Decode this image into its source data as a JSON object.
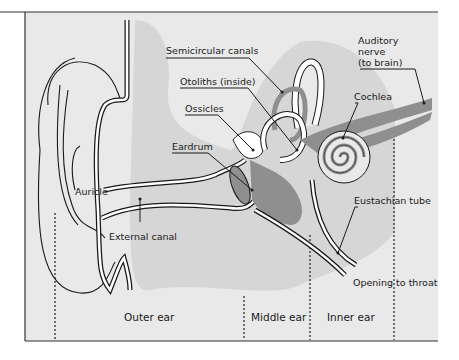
{
  "diagram": {
    "colors": {
      "panel_bg": "#e9e9e9",
      "shadow_region": "#d6d6d6",
      "tissue": "#8f8f8f",
      "line": "#1a1a1a",
      "canal_fill": "#ffffff"
    },
    "labels": {
      "semicircular_canals": "Semicircular canals",
      "otoliths": "Otoliths (inside)",
      "ossicles": "Ossicles",
      "eardrum": "Eardrum",
      "auricle": "Auricle",
      "external_canal": "External canal",
      "auditory_nerve_1": "Auditory",
      "auditory_nerve_2": "nerve",
      "auditory_nerve_3": "(to brain)",
      "cochlea": "Cochlea",
      "eustachian_tube": "Eustachian tube",
      "opening_to_throat": "Opening to throat"
    },
    "regions": {
      "outer_ear": "Outer ear",
      "middle_ear": "Middle ear",
      "inner_ear": "Inner ear"
    }
  }
}
